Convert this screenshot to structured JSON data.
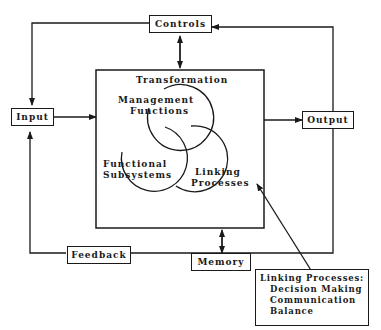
{
  "diagram": {
    "nodes": {
      "controls": "Controls",
      "input": "Input",
      "output": "Output",
      "memory": "Memory",
      "feedback": "Feedback",
      "transformation": "Transformation"
    },
    "circles": {
      "management_line1": "Management",
      "management_line2": "Functions",
      "functional_line1": "Functional",
      "functional_line2": "Subsystems",
      "linking_line1": "Linking",
      "linking_line2": "Processes"
    },
    "note": {
      "title": "Linking Processes:",
      "items": [
        "Decision Making",
        "Communication",
        "Balance"
      ]
    },
    "colors": {
      "line": "#1a1a1a",
      "background": "#ffffff"
    }
  }
}
